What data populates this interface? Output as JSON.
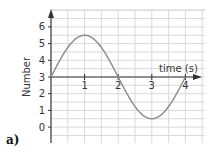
{
  "panel_label": "a)",
  "chart_data": {
    "type": "line",
    "title": "",
    "xlabel": "time (s)",
    "ylabel": "Number",
    "x_ticks": [
      "1",
      "2",
      "3",
      "4"
    ],
    "y_ticks": [
      "0",
      "1",
      "2",
      "3",
      "4",
      "5",
      "6"
    ],
    "xlim": [
      0,
      4.5
    ],
    "ylim": [
      -1,
      7
    ],
    "x_axis_crosses_y_at": 3,
    "grid": true,
    "legend": null,
    "series": [
      {
        "name": "Number",
        "function": "3 + 2.5*sin(pi*t/2)",
        "x": [
          0,
          0.25,
          0.5,
          0.75,
          1,
          1.25,
          1.5,
          1.75,
          2,
          2.25,
          2.5,
          2.75,
          3,
          3.25,
          3.5,
          3.75,
          4
        ],
        "values": [
          3,
          3.96,
          4.77,
          5.31,
          5.5,
          5.31,
          4.77,
          3.96,
          3,
          2.04,
          1.23,
          0.69,
          0.5,
          0.69,
          1.23,
          2.04,
          3
        ],
        "color": "#8a8a8a"
      }
    ],
    "key_points": [
      {
        "t": 0,
        "value": 3
      },
      {
        "t": 1,
        "value": 5.5,
        "note": "maximum"
      },
      {
        "t": 2,
        "value": 3
      },
      {
        "t": 3,
        "value": 0.5,
        "note": "minimum"
      },
      {
        "t": 4,
        "value": 3
      }
    ]
  },
  "colors": {
    "grid": "#d9d9d9",
    "axis": "#333333",
    "curve": "#8a8a8a"
  }
}
